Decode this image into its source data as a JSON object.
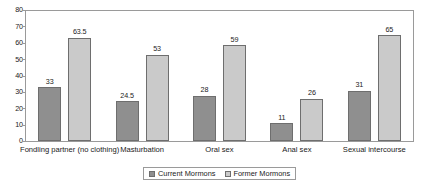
{
  "chart_data": {
    "type": "bar",
    "title": "",
    "xlabel": "",
    "ylabel": "",
    "ylim": [
      0,
      80
    ],
    "yticks": [
      80,
      70,
      60,
      50,
      40,
      30,
      20,
      10,
      0
    ],
    "grid": false,
    "legend_position": "bottom",
    "categories": [
      "Fondling partner (no clothing)",
      "Masturbation",
      "Oral sex",
      "Anal sex",
      "Sexual intercourse"
    ],
    "series": [
      {
        "name": "Current Mormons",
        "color": "#8f8f8f",
        "values": [
          33,
          24.5,
          28,
          11,
          31
        ],
        "labels": [
          "33",
          "24.5",
          "28",
          "11",
          "31"
        ]
      },
      {
        "name": "Former Mormons",
        "color": "#cacaca",
        "values": [
          63.5,
          53,
          59,
          26,
          65
        ],
        "labels": [
          "63.5",
          "53",
          "59",
          "26",
          "65"
        ]
      }
    ]
  },
  "axis": {
    "y_tick_labels": [
      "80",
      "70",
      "60",
      "50",
      "40",
      "30",
      "20",
      "10",
      "0"
    ]
  },
  "legend": {
    "items": [
      {
        "label": "Current Mormons",
        "color": "#8f8f8f"
      },
      {
        "label": "Former Mormons",
        "color": "#cacaca"
      }
    ]
  }
}
